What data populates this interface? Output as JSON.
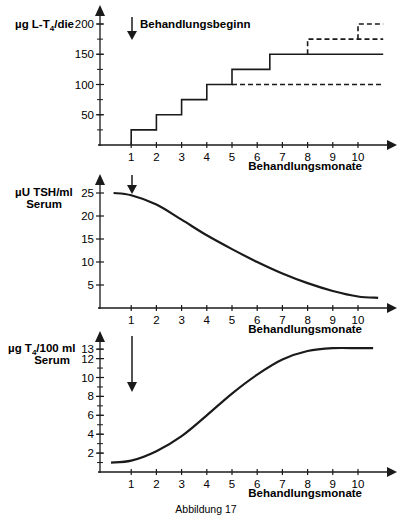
{
  "caption": "Abbildung 17",
  "chart_data": [
    {
      "type": "line",
      "subtype": "step",
      "title": "",
      "ylabel": "µg L-T4/die",
      "ylabel_main": "µg L-T",
      "ylabel_sub": "4",
      "ylabel_tail": "/die",
      "xlabel": "Behandlungsmonate",
      "annotation": "Behandlungsbeginn",
      "annotation_x": 1,
      "ylim": [
        0,
        200
      ],
      "xlim": [
        0,
        11
      ],
      "yticks": [
        50,
        100,
        150,
        200
      ],
      "ytick_labels": [
        "50",
        "100",
        "150",
        "200"
      ],
      "xticks": [
        1,
        2,
        3,
        4,
        5,
        6,
        7,
        8,
        9,
        10
      ],
      "xtick_labels": [
        "1",
        "2",
        "3",
        "4",
        "5",
        "6",
        "7",
        "8",
        "9",
        "10"
      ],
      "grid": false,
      "series": [
        {
          "name": "dose (solid)",
          "style": "solid",
          "x": [
            1,
            1,
            2,
            2,
            3,
            3,
            4,
            4,
            5,
            5,
            6.5,
            6.5,
            11
          ],
          "y": [
            0,
            25,
            25,
            50,
            50,
            75,
            75,
            100,
            100,
            125,
            125,
            150,
            150
          ]
        },
        {
          "name": "dose alternative 100",
          "style": "dashed",
          "x": [
            5,
            11
          ],
          "y": [
            100,
            100
          ]
        },
        {
          "name": "dose alternative 175",
          "style": "dashed",
          "x": [
            8,
            8,
            11
          ],
          "y": [
            150,
            175,
            175
          ]
        },
        {
          "name": "dose alternative 200",
          "style": "dashed",
          "x": [
            10,
            10,
            11
          ],
          "y": [
            175,
            200,
            200
          ]
        }
      ]
    },
    {
      "type": "line",
      "title": "",
      "ylabel": "µU TSH/ml Serum",
      "ylabel_line1": "µU TSH/ml",
      "ylabel_line2": "Serum",
      "xlabel": "Behandlungsmonate",
      "annotation_x": 1,
      "ylim": [
        0,
        28
      ],
      "xlim": [
        0,
        11
      ],
      "yticks": [
        5,
        10,
        15,
        20,
        25
      ],
      "ytick_labels": [
        "5",
        "10",
        "15",
        "20",
        "25"
      ],
      "xticks": [
        1,
        2,
        3,
        4,
        5,
        6,
        7,
        8,
        9,
        10
      ],
      "xtick_labels": [
        "1",
        "2",
        "3",
        "4",
        "5",
        "6",
        "7",
        "8",
        "9",
        "10"
      ],
      "grid": false,
      "series": [
        {
          "name": "TSH",
          "style": "solid",
          "x": [
            0.3,
            1,
            2,
            3,
            4,
            5,
            6,
            7,
            8,
            9,
            10,
            10.8
          ],
          "y": [
            25,
            24.5,
            22.5,
            19.2,
            15.8,
            12.8,
            10,
            7.5,
            5.4,
            3.7,
            2.5,
            2.2
          ]
        }
      ]
    },
    {
      "type": "line",
      "title": "",
      "ylabel": "µg T4/100 ml Serum",
      "ylabel_main": "µg T",
      "ylabel_sub": "4",
      "ylabel_tail": "/100 ml",
      "ylabel_line2": "Serum",
      "xlabel": "Behandlungsmonate",
      "annotation_x": 1,
      "ylim": [
        0,
        14
      ],
      "xlim": [
        0,
        11
      ],
      "yticks": [
        2,
        4,
        6,
        8,
        10,
        12,
        13
      ],
      "ytick_labels": [
        "2",
        "4",
        "6",
        "8",
        "10",
        "12",
        "13"
      ],
      "xticks": [
        1,
        2,
        3,
        4,
        5,
        6,
        7,
        8,
        9,
        10
      ],
      "xtick_labels": [
        "1",
        "2",
        "3",
        "4",
        "5",
        "6",
        "7",
        "8",
        "9",
        "10"
      ],
      "grid": false,
      "series": [
        {
          "name": "T4",
          "style": "solid",
          "x": [
            0.2,
            1,
            2,
            3,
            4,
            5,
            6,
            7,
            8,
            9,
            10,
            10.6
          ],
          "y": [
            1,
            1.2,
            2.2,
            3.8,
            6,
            8.3,
            10.3,
            11.9,
            12.8,
            13.1,
            13.1,
            13.1
          ]
        }
      ]
    }
  ]
}
